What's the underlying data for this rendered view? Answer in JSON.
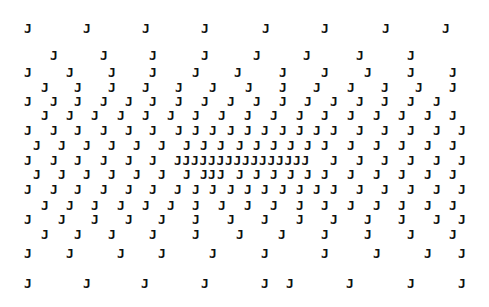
{
  "glyph": "J",
  "ink_color": "#111111",
  "background": "#ffffff",
  "rows": [
    {
      "y": 28,
      "x": [
        28,
        87,
        146,
        205,
        266,
        325,
        386,
        446
      ]
    },
    {
      "y": 55,
      "x": [
        54,
        104,
        153,
        205,
        257,
        307,
        360,
        411
      ]
    },
    {
      "y": 72,
      "x": [
        28,
        70,
        112,
        153,
        196,
        238,
        283,
        325,
        368,
        411,
        453
      ]
    },
    {
      "y": 87,
      "x": [
        45,
        78,
        112,
        146,
        179,
        213,
        249,
        283,
        317,
        351,
        385,
        419,
        453
      ]
    },
    {
      "y": 101,
      "x": [
        28,
        54,
        78,
        104,
        129,
        153,
        179,
        205,
        231,
        257,
        283,
        308,
        334,
        360,
        385,
        411,
        437
      ]
    },
    {
      "y": 115,
      "x": [
        45,
        70,
        95,
        121,
        146,
        171,
        196,
        222,
        248,
        274,
        300,
        325,
        351,
        377,
        402,
        428,
        453
      ]
    },
    {
      "y": 130,
      "x": [
        28,
        54,
        78,
        104,
        129,
        153,
        179,
        196,
        213,
        231,
        248,
        265,
        283,
        300,
        317,
        334,
        360,
        385,
        411,
        437,
        462
      ]
    },
    {
      "y": 145,
      "x": [
        37,
        62,
        87,
        112,
        137,
        162,
        187,
        204,
        221,
        240,
        257,
        274,
        291,
        308,
        325,
        351,
        377,
        402,
        428,
        453
      ]
    },
    {
      "y": 160,
      "x": [
        28,
        54,
        78,
        104,
        129,
        153,
        178,
        186.5,
        195,
        203.5,
        212,
        220.5,
        229,
        237.5,
        246,
        254.5,
        263,
        271.5,
        280,
        288.5,
        297,
        305.5,
        334,
        360,
        385,
        411,
        437,
        462
      ]
    },
    {
      "y": 174,
      "x": [
        37,
        62,
        87,
        112,
        137,
        162,
        187,
        204,
        212,
        221,
        240,
        257,
        274,
        291,
        308,
        325,
        351,
        377,
        402,
        428,
        453
      ]
    },
    {
      "y": 189,
      "x": [
        28,
        54,
        78,
        104,
        129,
        153,
        178,
        196,
        213,
        231,
        248,
        265,
        283,
        300,
        317,
        334,
        360,
        385,
        411,
        437,
        462
      ]
    },
    {
      "y": 205,
      "x": [
        45,
        70,
        95,
        121,
        146,
        171,
        196,
        222,
        248,
        274,
        300,
        325,
        351,
        377,
        402,
        428,
        453
      ]
    },
    {
      "y": 219,
      "x": [
        28,
        62,
        95,
        129,
        162,
        196,
        231,
        265,
        300,
        334,
        368,
        402,
        437,
        462
      ]
    },
    {
      "y": 234,
      "x": [
        45,
        78,
        112,
        153,
        196,
        240,
        282,
        325,
        368,
        411,
        453
      ]
    },
    {
      "y": 253,
      "x": [
        28,
        70,
        121,
        162,
        213,
        265,
        325,
        377,
        428,
        462
      ]
    },
    {
      "y": 283,
      "x": [
        28,
        87,
        145,
        205,
        265,
        290,
        350,
        411,
        462
      ]
    }
  ]
}
